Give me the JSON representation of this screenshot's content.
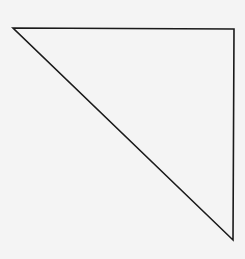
{
  "diagram": {
    "shape": "right-triangle",
    "background": "#f4f4f4",
    "stroke": "#1a1a1a",
    "stroke_width": 1.6,
    "fill": "none",
    "vertices": [
      {
        "x": 13,
        "y": 28
      },
      {
        "x": 234,
        "y": 29
      },
      {
        "x": 233,
        "y": 240
      }
    ]
  }
}
